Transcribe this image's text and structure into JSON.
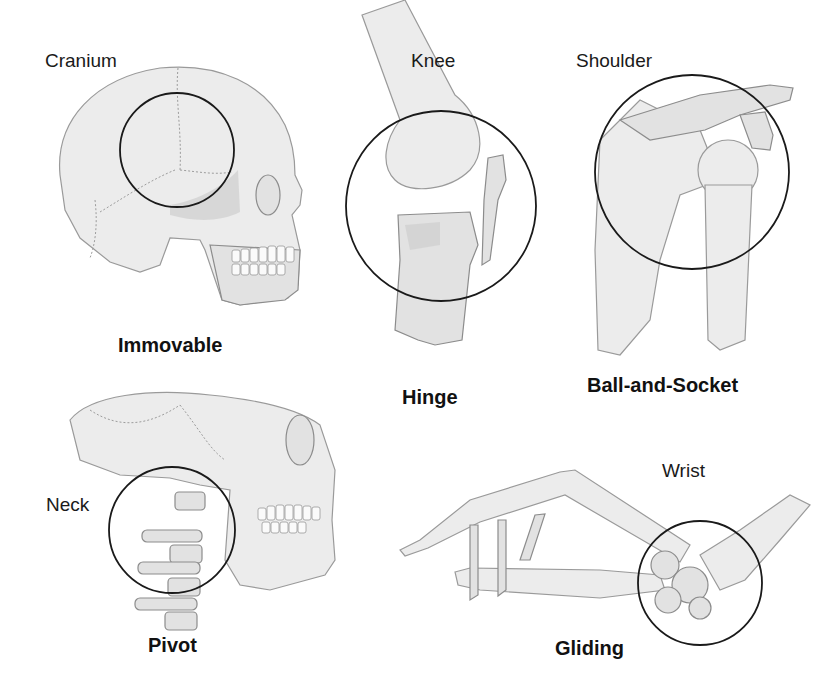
{
  "diagram": {
    "panels": [
      {
        "region": "Cranium",
        "joint_type": "Immovable"
      },
      {
        "region": "Knee",
        "joint_type": "Hinge"
      },
      {
        "region": "Shoulder",
        "joint_type": "Ball-and-Socket"
      },
      {
        "region": "Neck",
        "joint_type": "Pivot"
      },
      {
        "region": "Wrist",
        "joint_type": "Gliding"
      }
    ],
    "highlight": {
      "shape": "circle",
      "stroke_color": "#1a1a1a"
    },
    "background": "#ffffff"
  }
}
